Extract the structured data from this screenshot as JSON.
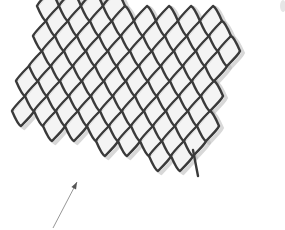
{
  "image": {
    "description": "Photograph of an expanded metal mesh sheet with a thin annotation arrow pointing toward its lower-left edge",
    "width": 285,
    "height": 230,
    "background": "#ffffff"
  },
  "mesh": {
    "stroke_color": "#3a3a3a",
    "highlight_color": "#d9d9d9",
    "shadow_color": "#b8b8b8",
    "stroke_width": 2.4,
    "cell_half_width": 11,
    "cell_half_height": 15,
    "cell_tilt": 2,
    "origin": [
      48,
      6
    ],
    "edge_vector_1": [
      9,
      15
    ],
    "edge_vector_2": [
      13,
      -15
    ],
    "clip_polygon": [
      [
        50,
        -4
      ],
      [
        236,
        24
      ],
      [
        200,
        168
      ],
      [
        12,
        114
      ]
    ],
    "strand_tail": [
      [
        193,
        150
      ],
      [
        198,
        176
      ]
    ]
  },
  "arrow": {
    "color": "#8a8a8a",
    "start": [
      53,
      228
    ],
    "end": [
      77,
      182
    ],
    "label": ""
  },
  "corner_smudge": {
    "position": [
      283,
      6
    ],
    "color": "#e6e6e6"
  }
}
